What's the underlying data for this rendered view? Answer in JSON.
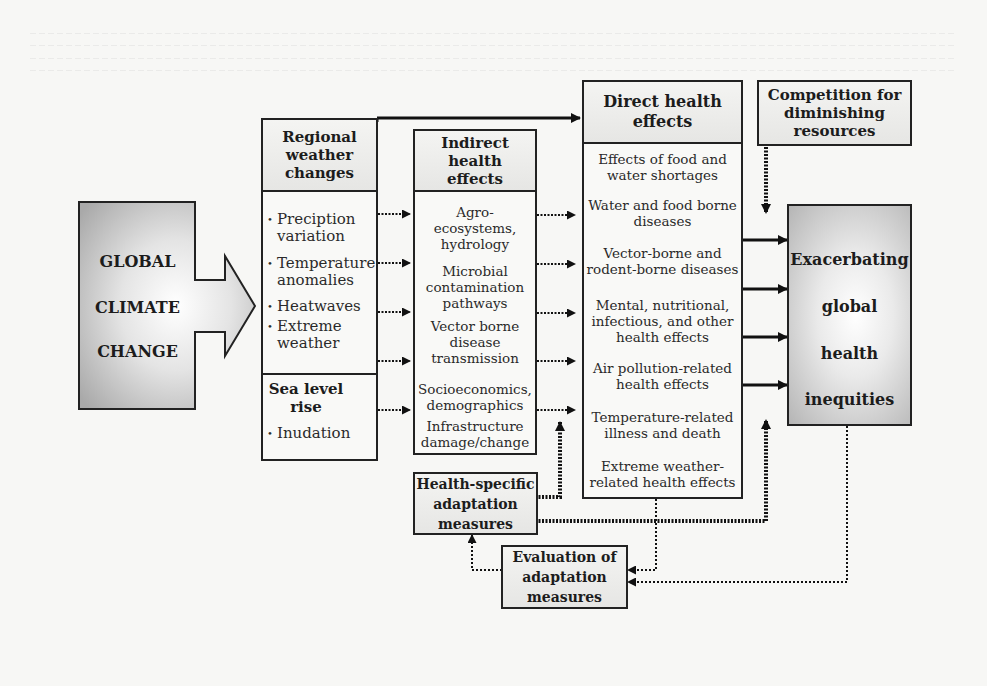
{
  "source": {
    "title": "GLOBAL CLIMATE CHANGE",
    "lines": [
      "GLOBAL",
      "CLIMATE",
      "CHANGE"
    ]
  },
  "regional_weather": {
    "title": "Regional weather changes",
    "title_lines": [
      "Regional",
      "weather",
      "changes"
    ],
    "items": [
      {
        "l1": "Preciption",
        "l2": "variation"
      },
      {
        "l1": "Temperature",
        "l2": "anomalies"
      },
      {
        "l1": "Heatwaves",
        "l2": ""
      },
      {
        "l1": "Extreme",
        "l2": "weather"
      }
    ]
  },
  "sea_level": {
    "title_lines": [
      "Sea level",
      "rise"
    ],
    "items": [
      "Inudation"
    ]
  },
  "indirect": {
    "title_lines": [
      "Indirect",
      "health",
      "effects"
    ],
    "items": [
      [
        "Agro-",
        "ecosystems,",
        "hydrology"
      ],
      [
        "Microbial",
        "contamination",
        "pathways"
      ],
      [
        "Vector borne",
        "disease",
        "transmission"
      ],
      [
        "Socioeconomics,",
        "demographics"
      ],
      [
        "Infrastructure",
        "damage/change"
      ]
    ]
  },
  "direct": {
    "title_lines": [
      "Direct health",
      "effects"
    ],
    "items": [
      [
        "Effects of food and",
        "water shortages"
      ],
      [
        "Water and food borne",
        "diseases"
      ],
      [
        "Vector-borne and",
        "rodent-borne diseases"
      ],
      [
        "Mental, nutritional,",
        "infectious, and other",
        "health effects"
      ],
      [
        "Air pollution-related",
        "health effects"
      ],
      [
        "Temperature-related",
        "illness and death"
      ],
      [
        "Extreme weather-",
        "related health effects"
      ]
    ]
  },
  "competition": {
    "title_lines": [
      "Competition for",
      "diminishing",
      "resources"
    ]
  },
  "outcome": {
    "lines": [
      "Exacerbating",
      "global",
      "health",
      "inequities"
    ]
  },
  "adaptation": {
    "title_lines": [
      "Health-specific",
      "adaptation",
      "measures"
    ]
  },
  "evaluation": {
    "title_lines": [
      "Evaluation of",
      "adaptation",
      "measures"
    ]
  }
}
